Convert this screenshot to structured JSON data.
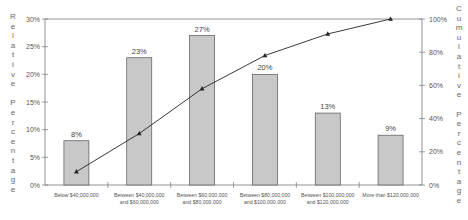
{
  "chart_data": {
    "type": "bar",
    "title": "",
    "categories": [
      [
        "Below $40,000,000"
      ],
      [
        "Between $40,000,000",
        "and $60,000,000"
      ],
      [
        "Between $60,000,000",
        "and $80,000,000"
      ],
      [
        "Between $80,000,000",
        "and $100,000,000"
      ],
      [
        "Between $100,000,000",
        "and $120,000,000"
      ],
      [
        "More than $120,000,000"
      ]
    ],
    "series": [
      {
        "name": "Relative Percentage",
        "type": "bar",
        "axis": "left",
        "values": [
          8,
          23,
          27,
          20,
          13,
          9
        ],
        "labels": [
          "8%",
          "23%",
          "27%",
          "20%",
          "13%",
          "9%"
        ]
      },
      {
        "name": "Cumulative Percentage",
        "type": "line",
        "axis": "right",
        "marker": "triangle",
        "values": [
          8,
          31,
          58,
          78,
          91,
          100
        ]
      }
    ],
    "ylabel": "Relative Percentage",
    "y2label": "Cumulative Percentage",
    "ylim": [
      0,
      30
    ],
    "y2lim": [
      0,
      100
    ],
    "yticks": [
      "0%",
      "5%",
      "10%",
      "15%",
      "20%",
      "25%",
      "30%"
    ],
    "y2ticks": [
      "0%",
      "20%",
      "40%",
      "60%",
      "80%",
      "100%"
    ],
    "grid": false,
    "legend": false
  },
  "colors": {
    "bar_fill": "#c8c8c8",
    "bar_stroke": "#555555",
    "line": "#222222",
    "axis": "#777777"
  }
}
